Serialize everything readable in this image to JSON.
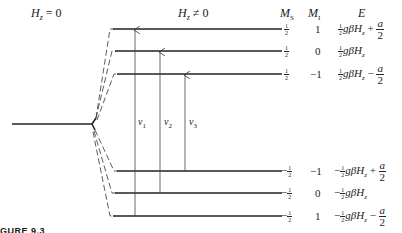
{
  "headers": {
    "zero_field": "H_z = 0",
    "zero_field_main": "H",
    "zero_field_sub": "z",
    "zero_field_rest": " = 0",
    "nonzero_field_main": "H",
    "nonzero_field_sub": "z",
    "nonzero_field_rest": " ≠ 0",
    "ms": "M",
    "ms_sub": "S",
    "mi": "M",
    "mi_sub": "I",
    "energy": "E"
  },
  "levels": [
    {
      "ms_sign": "",
      "ms_num": "1",
      "ms_den": "2",
      "mi": "1",
      "e_sign": "",
      "e_num": "1",
      "e_den": "2",
      "e_body": "gβH",
      "e_sub": "z",
      "e_tail_op": " + ",
      "a_num": "a",
      "a_den": "2"
    },
    {
      "ms_sign": "",
      "ms_num": "1",
      "ms_den": "2",
      "mi": "0",
      "e_sign": "",
      "e_num": "1",
      "e_den": "2",
      "e_body": "gβH",
      "e_sub": "z",
      "e_tail_op": "",
      "a_num": "",
      "a_den": ""
    },
    {
      "ms_sign": "",
      "ms_num": "1",
      "ms_den": "2",
      "mi": "−1",
      "e_sign": "",
      "e_num": "1",
      "e_den": "2",
      "e_body": "gβH",
      "e_sub": "z",
      "e_tail_op": " − ",
      "a_num": "a",
      "a_den": "2"
    },
    {
      "ms_sign": "−",
      "ms_num": "1",
      "ms_den": "2",
      "mi": "−1",
      "e_sign": "−",
      "e_num": "1",
      "e_den": "2",
      "e_body": "gβH",
      "e_sub": "z",
      "e_tail_op": " + ",
      "a_num": "a",
      "a_den": "2"
    },
    {
      "ms_sign": "−",
      "ms_num": "1",
      "ms_den": "2",
      "mi": "0",
      "e_sign": "−",
      "e_num": "1",
      "e_den": "2",
      "e_body": "gβH",
      "e_sub": "z",
      "e_tail_op": "",
      "a_num": "",
      "a_den": ""
    },
    {
      "ms_sign": "−",
      "ms_num": "1",
      "ms_den": "2",
      "mi": "1",
      "e_sign": "−",
      "e_num": "1",
      "e_den": "2",
      "e_body": "gβH",
      "e_sub": "z",
      "e_tail_op": " − ",
      "a_num": "a",
      "a_den": "2"
    }
  ],
  "transitions": [
    {
      "label": "ν",
      "sub": "1"
    },
    {
      "label": "ν",
      "sub": "2"
    },
    {
      "label": "ν",
      "sub": "3"
    }
  ],
  "caption": "FIGURE 9.3",
  "caption_visible": "GURE 9.3"
}
